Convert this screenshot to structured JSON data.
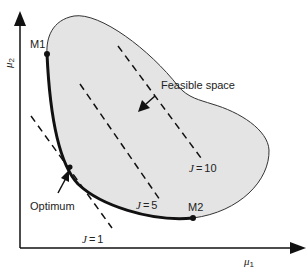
{
  "diagram": {
    "type": "multi-objective optimization feasible space",
    "axes": {
      "x_label": "μ",
      "x_label_sub": "1",
      "y_label": "μ",
      "y_label_sub": "2"
    },
    "region": {
      "label": "Feasible space",
      "fill_color": "#e4e4e4",
      "outline_color": "#333333"
    },
    "pareto_front": {
      "color": "#111111",
      "endpoints": {
        "start_label": "M1",
        "end_label": "M2"
      }
    },
    "optimum": {
      "label": "Optimum"
    },
    "contours": [
      {
        "label": "J = 1",
        "j_prefix": "J",
        "j_value": "1"
      },
      {
        "label": "J = 5",
        "j_prefix": "J",
        "j_value": "5"
      },
      {
        "label": "J = 10",
        "j_prefix": "J",
        "j_value": "10"
      }
    ]
  }
}
